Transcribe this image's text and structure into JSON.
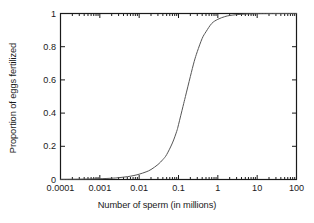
{
  "chart_data": {
    "type": "line",
    "title": "",
    "xlabel": "Number of sperm (in millions)",
    "ylabel": "Proportion of eggs fertilized",
    "xscale": "log",
    "yscale": "linear",
    "xlim": [
      0.0001,
      100
    ],
    "ylim": [
      0,
      1
    ],
    "grid": false,
    "legend": null,
    "xticks": [
      {
        "value": 0.0001,
        "label": "0.0001"
      },
      {
        "value": 0.001,
        "label": "0.001"
      },
      {
        "value": 0.01,
        "label": "0.01"
      },
      {
        "value": 0.1,
        "label": "0.1"
      },
      {
        "value": 1,
        "label": "1"
      },
      {
        "value": 10,
        "label": "10"
      },
      {
        "value": 100,
        "label": "100"
      }
    ],
    "yticks": [
      {
        "value": 0,
        "label": "0"
      },
      {
        "value": 0.2,
        "label": "0.2"
      },
      {
        "value": 0.4,
        "label": "0.4"
      },
      {
        "value": 0.6,
        "label": "0.6"
      },
      {
        "value": 0.8,
        "label": "0.8"
      },
      {
        "value": 1,
        "label": "1"
      }
    ],
    "series": [
      {
        "name": "fertilization-curve",
        "color": "#555555",
        "points": [
          {
            "x": 0.0001,
            "y": 0.0008
          },
          {
            "x": 0.0002,
            "y": 0.0013
          },
          {
            "x": 0.0005,
            "y": 0.0026
          },
          {
            "x": 0.001,
            "y": 0.0045
          },
          {
            "x": 0.002,
            "y": 0.0078
          },
          {
            "x": 0.003,
            "y": 0.011
          },
          {
            "x": 0.005,
            "y": 0.017
          },
          {
            "x": 0.007,
            "y": 0.023
          },
          {
            "x": 0.01,
            "y": 0.032
          },
          {
            "x": 0.015,
            "y": 0.046
          },
          {
            "x": 0.02,
            "y": 0.06
          },
          {
            "x": 0.03,
            "y": 0.09
          },
          {
            "x": 0.04,
            "y": 0.12
          },
          {
            "x": 0.05,
            "y": 0.15
          },
          {
            "x": 0.07,
            "y": 0.22
          },
          {
            "x": 0.09,
            "y": 0.29
          },
          {
            "x": 0.1,
            "y": 0.33
          },
          {
            "x": 0.13,
            "y": 0.44
          },
          {
            "x": 0.15,
            "y": 0.5
          },
          {
            "x": 0.2,
            "y": 0.62
          },
          {
            "x": 0.25,
            "y": 0.71
          },
          {
            "x": 0.3,
            "y": 0.77
          },
          {
            "x": 0.4,
            "y": 0.85
          },
          {
            "x": 0.5,
            "y": 0.89
          },
          {
            "x": 0.7,
            "y": 0.94
          },
          {
            "x": 1,
            "y": 0.965
          },
          {
            "x": 1.5,
            "y": 0.981
          },
          {
            "x": 2,
            "y": 0.988
          },
          {
            "x": 3,
            "y": 0.993
          },
          {
            "x": 5,
            "y": 0.997
          },
          {
            "x": 7,
            "y": 0.998
          },
          {
            "x": 10,
            "y": 0.999
          },
          {
            "x": 20,
            "y": 0.9995
          },
          {
            "x": 50,
            "y": 0.9999
          },
          {
            "x": 100,
            "y": 1.0
          }
        ]
      }
    ],
    "annotations": [],
    "minor_ticks": true,
    "axis_color": "#1a1a1a",
    "background": "#ffffff"
  }
}
